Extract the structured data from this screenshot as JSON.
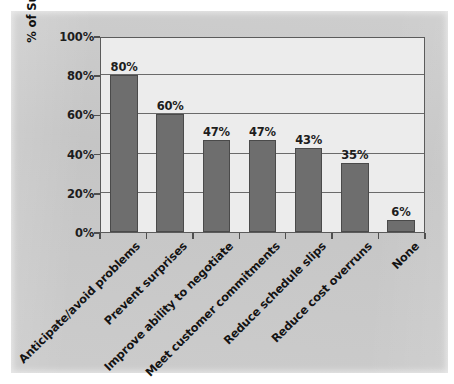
{
  "chart_data": {
    "type": "bar",
    "title": "",
    "subtitle": "",
    "xlabel": "",
    "ylabel": "% of Survey Respondents",
    "ylim": [
      0,
      100
    ],
    "yticks": [
      "0%",
      "20%",
      "40%",
      "60%",
      "80%",
      "100%"
    ],
    "ytick_values": [
      0,
      20,
      40,
      60,
      80,
      100
    ],
    "grid": "horizontal",
    "legend": "none",
    "categories": [
      "Anticipate/avoid problems",
      "Prevent surprises",
      "Improve ability to negotiate",
      "Meet customer commitments",
      "Reduce schedule slips",
      "Reduce cost overruns",
      "None"
    ],
    "values": [
      80,
      60,
      47,
      47,
      43,
      35,
      6
    ],
    "data_labels": [
      "80%",
      "60%",
      "47%",
      "47%",
      "43%",
      "35%",
      "6%"
    ],
    "bar_color": "#6e6e6e",
    "bar_edge_color": "#4a4a4a",
    "plot_background": "#ececec",
    "panel_background": "#c7c7c7",
    "axis_color": "#5b5b5b",
    "gridline_color": "#6a6a6a",
    "text_color": "#1d1d1d",
    "xlabel_rotation": "-45"
  }
}
